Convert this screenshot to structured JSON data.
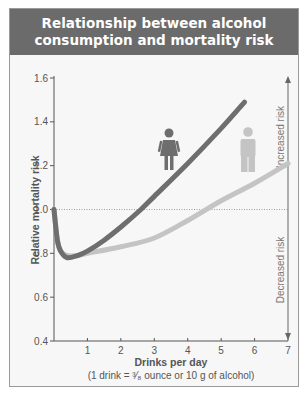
{
  "title_line1": "Relationship between alcohol",
  "title_line2": "consumption and mortality risk",
  "chart_data": {
    "type": "line",
    "title": "Relationship between alcohol consumption and mortality risk",
    "xlabel": "Drinks per day",
    "xlabel_note": "(1 drink = ³⁄₈ ounce or 10 g of alcohol)",
    "ylabel": "Relative mortality risk",
    "xlim": [
      0,
      7
    ],
    "ylim": [
      0.4,
      1.6
    ],
    "x_ticks": [
      "1",
      "2",
      "3",
      "4",
      "5",
      "6",
      "7"
    ],
    "y_ticks": [
      "0.4",
      "0.6",
      "0.8",
      "1.0",
      "1.2",
      "1.4",
      "1.6"
    ],
    "reference_line": {
      "y": 1.0,
      "style": "dotted"
    },
    "grid": false,
    "legend": "icons (female figure = dark line, male figure = light line)",
    "annotations": [
      "Increased risk",
      "Decreased risk"
    ],
    "series": [
      {
        "name": "Women",
        "color": "#6e6e6e",
        "x": [
          0,
          0.1,
          0.2,
          0.4,
          0.7,
          1.0,
          1.5,
          2.0,
          2.6,
          3.0,
          4.0,
          5.0,
          5.7
        ],
        "y": [
          1.0,
          0.86,
          0.81,
          0.78,
          0.79,
          0.81,
          0.86,
          0.92,
          1.0,
          1.06,
          1.21,
          1.37,
          1.49
        ]
      },
      {
        "name": "Men",
        "color": "#c4c4c4",
        "x": [
          0,
          0.1,
          0.2,
          0.4,
          0.7,
          1.0,
          2.0,
          3.0,
          4.0,
          5.0,
          6.0,
          7.0
        ],
        "y": [
          1.0,
          0.86,
          0.81,
          0.79,
          0.79,
          0.8,
          0.83,
          0.87,
          0.95,
          1.04,
          1.12,
          1.21
        ]
      }
    ]
  },
  "colors": {
    "title_bg": "#6b6b6b",
    "women_line": "#6e6e6e",
    "men_line": "#c4c4c4",
    "axis": "#555555"
  }
}
